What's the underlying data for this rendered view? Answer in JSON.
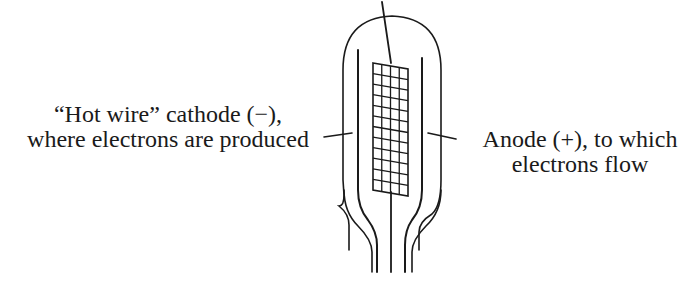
{
  "diagram": {
    "labels": {
      "cathode": {
        "line1": "“Hot wire” cathode (−),",
        "line2": "where electrons are produced"
      },
      "anode": {
        "line1": "Anode (+), to which",
        "line2": "electrons flow"
      }
    },
    "components": [
      "glass-bulb",
      "cathode-wire",
      "anode-plate",
      "grid-mesh",
      "grid-lead",
      "base-pins"
    ],
    "grid": {
      "columns": 4,
      "rows": 12
    },
    "colors": {
      "ink": "#1a1a1a",
      "background": "#ffffff"
    }
  }
}
